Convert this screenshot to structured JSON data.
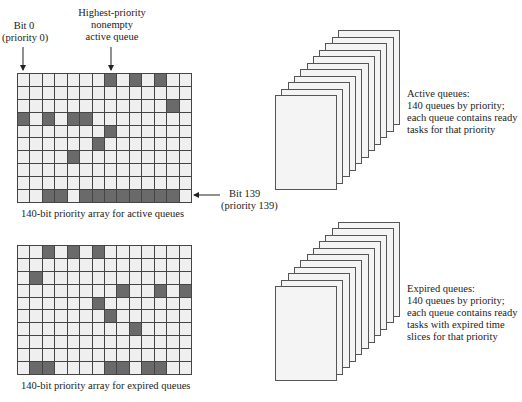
{
  "annotations": {
    "bit0": [
      "Bit 0",
      "(priority 0)"
    ],
    "highest": [
      "Highest-priority",
      "nonempty",
      "active queue"
    ],
    "bit139": [
      "Bit 139",
      "(priority 139)"
    ]
  },
  "active_array": {
    "caption": "140-bit priority array for active queues",
    "cols": 14,
    "rows": 10,
    "set_bits": [
      [
        0,
        7
      ],
      [
        0,
        9
      ],
      [
        0,
        11
      ],
      [
        2,
        12
      ],
      [
        3,
        0
      ],
      [
        3,
        2
      ],
      [
        3,
        4
      ],
      [
        3,
        5
      ],
      [
        4,
        7
      ],
      [
        5,
        6
      ],
      [
        6,
        4
      ],
      [
        9,
        2
      ],
      [
        9,
        3
      ],
      [
        9,
        5
      ],
      [
        9,
        6
      ],
      [
        9,
        7
      ],
      [
        9,
        8
      ],
      [
        9,
        9
      ],
      [
        9,
        10
      ],
      [
        9,
        11
      ],
      [
        9,
        12
      ]
    ]
  },
  "expired_array": {
    "caption": "140-bit priority array for expired queues",
    "cols": 14,
    "rows": 10,
    "set_bits": [
      [
        0,
        2
      ],
      [
        0,
        4
      ],
      [
        0,
        6
      ],
      [
        2,
        1
      ],
      [
        3,
        8
      ],
      [
        3,
        11
      ],
      [
        3,
        13
      ],
      [
        4,
        6
      ],
      [
        5,
        7
      ],
      [
        6,
        9
      ],
      [
        9,
        1
      ],
      [
        9,
        2
      ],
      [
        9,
        7
      ],
      [
        9,
        8
      ],
      [
        9,
        10
      ],
      [
        9,
        11
      ]
    ]
  },
  "active_queues": {
    "title": "Active queues:",
    "lines": [
      "140 queues by priority;",
      "each queue contains ready",
      "tasks for that priority"
    ],
    "page_count": 11
  },
  "expired_queues": {
    "title": "Expired queues:",
    "lines": [
      "140 queues by priority;",
      "each queue contains ready",
      "tasks with expired time",
      "slices for that priority"
    ],
    "page_count": 11
  },
  "colors": {
    "set_bit": "#6a6a6a",
    "clear_bit": "#efefef",
    "grid_line": "#444444"
  }
}
